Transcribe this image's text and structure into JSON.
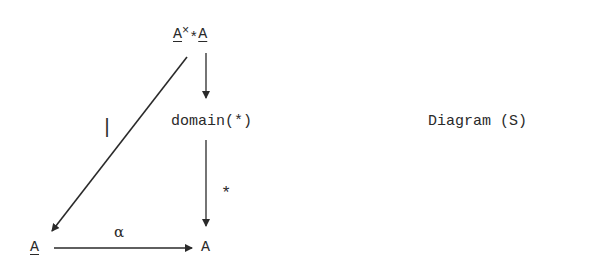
{
  "diagram": {
    "caption": "Diagram (S)",
    "nodes": {
      "top": {
        "left": "A",
        "times": "×",
        "star": "*",
        "right": "A"
      },
      "middle": "domain(*)",
      "bottom_left": "A",
      "bottom_right": "A"
    },
    "edge_labels": {
      "diagonal": "|",
      "middle_to_bottom": "*",
      "bottom": "α"
    },
    "colors": {
      "ink": "#2a2a2a",
      "background": "#ffffff"
    }
  }
}
